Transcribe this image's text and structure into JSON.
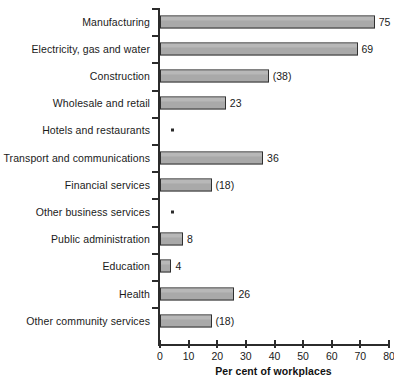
{
  "chart_data": {
    "type": "bar",
    "orientation": "horizontal",
    "title": "",
    "xlabel": "Per cent of workplaces",
    "ylabel": "",
    "xlim": [
      0,
      80
    ],
    "xticks": [
      0,
      10,
      20,
      30,
      40,
      50,
      60,
      70,
      80
    ],
    "xtick_labels": [
      "0",
      "10",
      "20",
      "30",
      "40",
      "50",
      "60",
      "70",
      "80"
    ],
    "grid": false,
    "legend": null,
    "footnote_symbol": "*",
    "categories": [
      "Manufacturing",
      "Electricity, gas and water",
      "Construction",
      "Wholesale and retail",
      "Hotels and restaurants",
      "Transport and communications",
      "Financial services",
      "Other business services",
      "Public administration",
      "Education",
      "Health",
      "Other community services"
    ],
    "values": [
      75,
      69,
      38,
      23,
      null,
      36,
      18,
      null,
      8,
      4,
      26,
      18
    ],
    "data_labels": [
      "75",
      "69",
      "(38)",
      "23",
      "*",
      "36",
      "(18)",
      "*",
      "8",
      "4",
      "26",
      "(18)"
    ],
    "bars": [
      {
        "category": "Manufacturing",
        "value": 75,
        "label": "75",
        "suppressed": false
      },
      {
        "category": "Electricity, gas and water",
        "value": 69,
        "label": "69",
        "suppressed": false
      },
      {
        "category": "Construction",
        "value": 38,
        "label": "(38)",
        "suppressed": false
      },
      {
        "category": "Wholesale and retail",
        "value": 23,
        "label": "23",
        "suppressed": false
      },
      {
        "category": "Hotels and restaurants",
        "value": null,
        "label": "*",
        "suppressed": true
      },
      {
        "category": "Transport and communications",
        "value": 36,
        "label": "36",
        "suppressed": false
      },
      {
        "category": "Financial services",
        "value": 18,
        "label": "(18)",
        "suppressed": false
      },
      {
        "category": "Other business services",
        "value": null,
        "label": "*",
        "suppressed": true
      },
      {
        "category": "Public administration",
        "value": 8,
        "label": "8",
        "suppressed": false
      },
      {
        "category": "Education",
        "value": 4,
        "label": "4",
        "suppressed": false
      },
      {
        "category": "Health",
        "value": 26,
        "label": "26",
        "suppressed": false
      },
      {
        "category": "Other community services",
        "value": 18,
        "label": "(18)",
        "suppressed": false
      }
    ],
    "colors": {
      "bar_fill": "#a9a9a9",
      "bar_border": "#303030",
      "axis": "#2b2b2b",
      "text": "#1a1a1a",
      "background": "#ffffff"
    }
  }
}
